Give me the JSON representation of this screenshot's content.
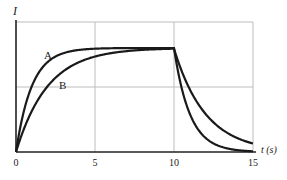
{
  "chart_data": {
    "type": "line",
    "title": "",
    "xlabel": "t (s)",
    "ylabel": "I",
    "xlim": [
      0,
      15
    ],
    "x_ticks": [
      "0",
      "5",
      "10",
      "15"
    ],
    "y_ticks": [],
    "grid": true,
    "legend": "inline labels",
    "series": [
      {
        "name": "A",
        "description": "rises quickly (time constant ~1 s) to plateau, switch-off at t=10 s, decays quickly",
        "x": [
          0,
          1,
          2,
          3,
          4,
          5,
          10,
          11,
          12,
          13,
          14,
          15
        ],
        "y_relative": [
          0,
          0.63,
          0.86,
          0.95,
          0.98,
          0.99,
          1.0,
          0.37,
          0.14,
          0.05,
          0.02,
          0.01
        ]
      },
      {
        "name": "B",
        "description": "rises more slowly (time constant ~2 s) to plateau, switch-off at t=10 s, decays slowly",
        "x": [
          0,
          1,
          2,
          3,
          4,
          5,
          10,
          11,
          12,
          13,
          14,
          15
        ],
        "y_relative": [
          0,
          0.39,
          0.63,
          0.78,
          0.86,
          0.92,
          1.0,
          0.61,
          0.37,
          0.22,
          0.14,
          0.08
        ]
      }
    ],
    "annotations": [
      "A",
      "B"
    ]
  },
  "labels": {
    "y_axis": "I",
    "x_axis": "t (s)",
    "curve_a": "A",
    "curve_b": "B",
    "tick0": "0",
    "tick5": "5",
    "tick10": "10",
    "tick15": "15"
  }
}
